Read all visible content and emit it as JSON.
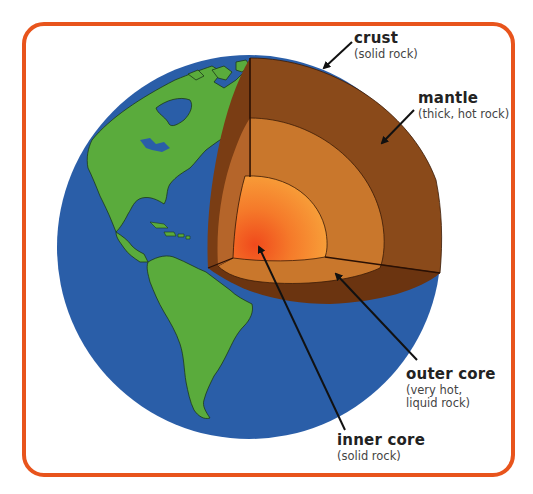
{
  "diagram": {
    "colors": {
      "frame": "#e8541c",
      "ocean": "#2a5ea8",
      "land": "#5aab3c",
      "crust": "#6b3410",
      "crust_side": "#7a3d14",
      "mantle": "#8a4a1a",
      "outer_core": "#c9772c",
      "inner_core_edge": "#f7a03a",
      "inner_core_center": "#f04a1c",
      "arrow": "#111111"
    },
    "labels": [
      {
        "id": "crust",
        "title": "crust",
        "subtitle": "(solid rock)"
      },
      {
        "id": "mantle",
        "title": "mantle",
        "subtitle": "(thick, hot rock)"
      },
      {
        "id": "outer-core",
        "title": "outer core",
        "subtitle": "(very hot,\nliquid rock)"
      },
      {
        "id": "inner-core",
        "title": "inner core",
        "subtitle": "(solid rock)"
      }
    ]
  }
}
